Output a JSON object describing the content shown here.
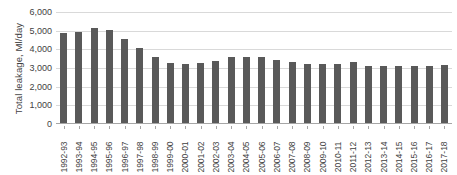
{
  "chart_data": {
    "type": "bar",
    "title": "",
    "xlabel": "",
    "ylabel": "Total leakage, Ml/day",
    "ylim": [
      0,
      6000
    ],
    "yticks": [
      0,
      1000,
      2000,
      3000,
      4000,
      5000,
      6000
    ],
    "ytick_labels": [
      "0",
      "1,000",
      "2,000",
      "3,000",
      "4,000",
      "5,000",
      "6,000"
    ],
    "grid": true,
    "legend": null,
    "bar_color": "#595959",
    "gridline_color": "#d9d9d9",
    "axis_color": "#a6a6a6",
    "text_color": "#3f3f3f",
    "categories": [
      "1992-93",
      "1993-94",
      "1994-95",
      "1995-96",
      "1996-97",
      "1997-98",
      "1998-99",
      "1999-00",
      "2000-01",
      "2001-02",
      "2002-03",
      "2003-04",
      "2004-05",
      "2005-06",
      "2006-07",
      "2007-08",
      "2008-09",
      "2009-10",
      "2010-11",
      "2011-12",
      "2012-13",
      "2013-14",
      "2014-15",
      "2015-16",
      "2016-17",
      "2017-18"
    ],
    "values": [
      4900,
      4950,
      5150,
      5050,
      4550,
      4050,
      3600,
      3250,
      3200,
      3250,
      3400,
      3600,
      3600,
      3600,
      3450,
      3300,
      3200,
      3200,
      3200,
      3300,
      3100,
      3100,
      3100,
      3100,
      3100,
      3150
    ]
  }
}
